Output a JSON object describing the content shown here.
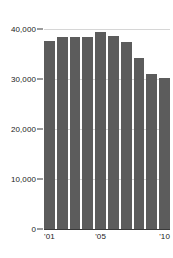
{
  "chart_data": {
    "type": "bar",
    "title": "",
    "subtitle": "",
    "xlabel": "",
    "ylabel": "",
    "categories": [
      "'01",
      "'02",
      "'03",
      "'04",
      "'05",
      "'06",
      "'07",
      "'08",
      "'09",
      "'10"
    ],
    "values": [
      37700,
      38500,
      38400,
      38400,
      39400,
      38700,
      37500,
      34300,
      31000,
      30300
    ],
    "series": [
      {
        "name": "",
        "values": [
          37700,
          38500,
          38400,
          38400,
          39400,
          38700,
          37500,
          34300,
          31000,
          30300
        ]
      }
    ],
    "ylim": [
      0,
      41500
    ],
    "xlim": [
      0,
      10
    ],
    "y_ticks": [
      0,
      10000,
      20000,
      30000,
      40000
    ],
    "y_tick_labels": [
      "0",
      "10,000",
      "20,000",
      "30,000",
      "40,000"
    ],
    "x_tick_labels": [
      "'01",
      "'05",
      "'10"
    ],
    "x_tick_indices": [
      0,
      4,
      9
    ],
    "grid": true,
    "grid_axis": "y",
    "legend": false,
    "legend_position": "none",
    "bar_color": "#5c5c5c",
    "grid_color": "#d6d6d6",
    "axis_color": "#3a3a3a",
    "background_color": "#ffffff",
    "text_color": "#1a1a1a"
  }
}
